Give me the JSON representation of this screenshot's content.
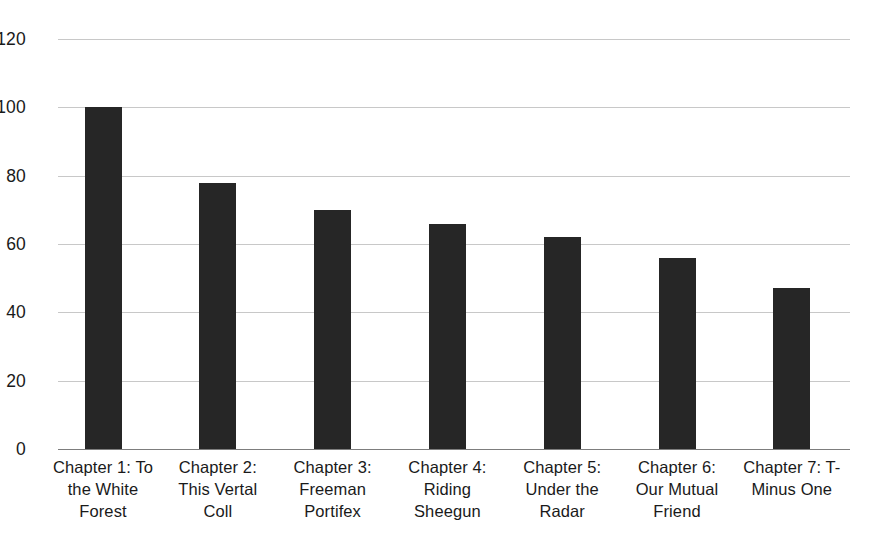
{
  "chart_data": {
    "type": "bar",
    "title": "",
    "subtitle": "",
    "xlabel": "",
    "ylabel": "",
    "ylim": [
      0,
      120
    ],
    "yticks": [
      0,
      20,
      40,
      60,
      80,
      100,
      120
    ],
    "grid": "horizontal",
    "legend": "none",
    "orientation": "vertical",
    "bar_color": "#262626",
    "gridline_color": "#c8c8c8",
    "axis_color": "#7d7d7d",
    "categories": [
      "Chapter 1: To the White Forest",
      "Chapter 2: This Vertal Coll",
      "Chapter 3: Freeman Portifex",
      "Chapter 4: Riding Sheegun",
      "Chapter 5: Under the Radar",
      "Chapter 6: Our Mutual Friend",
      "Chapter 7: T-Minus One"
    ],
    "category_lines": [
      [
        "Chapter 1: To",
        "the White",
        "Forest"
      ],
      [
        "Chapter 2:",
        "This Vertal",
        "Coll"
      ],
      [
        "Chapter 3:",
        "Freeman",
        "Portifex"
      ],
      [
        "Chapter 4:",
        "Riding",
        "Sheegun"
      ],
      [
        "Chapter 5:",
        "Under the",
        "Radar"
      ],
      [
        "Chapter 6:",
        "Our Mutual",
        "Friend"
      ],
      [
        "Chapter 7: T-",
        "Minus One"
      ]
    ],
    "values": [
      100,
      78,
      70,
      66,
      62,
      56,
      47
    ]
  }
}
